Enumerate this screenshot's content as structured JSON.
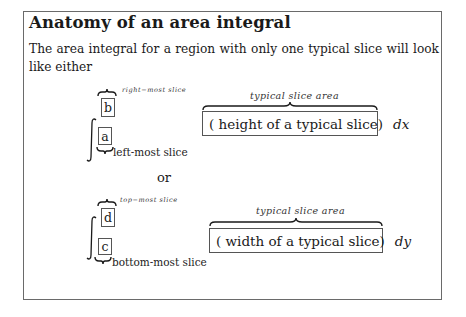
{
  "document": {
    "title": "Anatomy of an area integral",
    "intro": "The area integral for a region with only one typical slice will look like either"
  },
  "option_dx": {
    "upper_limit": "b",
    "lower_limit": "a",
    "upper_annotation": "right−most slice",
    "lower_annotation": "left-most  slice",
    "integrand_annotation": "typical slice area",
    "integrand_text": "( height of a typical slice)",
    "differential": "dx"
  },
  "separator": "or",
  "option_dy": {
    "upper_limit": "d",
    "lower_limit": "c",
    "upper_annotation": "top−most slice",
    "lower_annotation": "bottom-most  slice",
    "integrand_annotation": "typical slice area",
    "integrand_text": "( width of a typical slice)",
    "differential": "dy"
  },
  "colors": {
    "text": "#1a1a1a",
    "border": "#6a6a6a",
    "background": "#ffffff"
  }
}
